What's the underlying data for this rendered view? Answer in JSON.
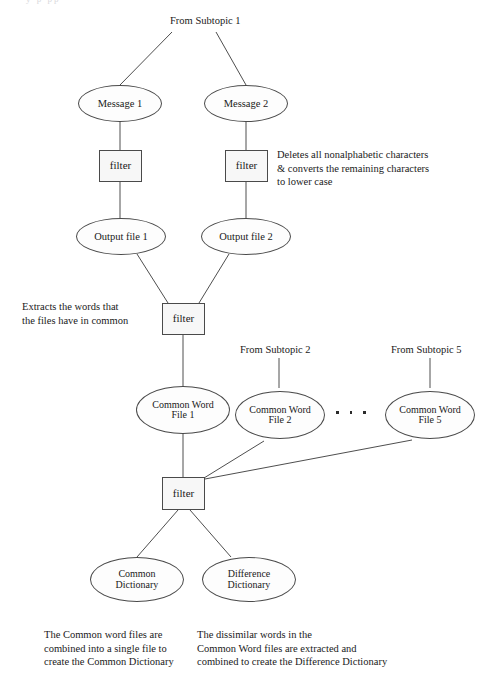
{
  "diagram": {
    "title_sliver": "y   p     pp",
    "sources": {
      "subtopic1": "From Subtopic 1",
      "subtopic2": "From Subtopic 2",
      "subtopic5": "From Subtopic 5"
    },
    "nodes": {
      "message1": "Message 1",
      "message2": "Message 2",
      "filter_a": "filter",
      "filter_b": "filter",
      "output_file1": "Output file 1",
      "output_file2": "Output file 2",
      "filter_common": "filter",
      "common_word_file1_l1": "Common Word",
      "common_word_file1_l2": "File 1",
      "common_word_file2_l1": "Common Word",
      "common_word_file2_l2": "File 2",
      "common_word_file5_l1": "Common Word",
      "common_word_file5_l2": "File 5",
      "filter_dict": "filter",
      "common_dictionary_l1": "Common",
      "common_dictionary_l2": "Dictionary",
      "difference_dictionary_l1": "Difference",
      "difference_dictionary_l2": "Dictionary"
    },
    "notes": {
      "filter_message": "Deletes all nonalphabetic characters\n& converts the remaining characters\nto lower case",
      "filter_common": "Extracts the words that\nthe files have in common",
      "common_dictionary": "The Common word files are\ncombined into a single file to\ncreate the Common Dictionary",
      "difference_dictionary": "The dissimilar words in the\nCommon Word files are extracted and\ncombined to create the Difference Dictionary"
    },
    "ellipsis": "· · ·",
    "colors": {
      "stroke": "#4a4a4a",
      "text": "#1a1a1a",
      "box_fill": "#f7f7f7",
      "page": "#ffffff"
    }
  }
}
